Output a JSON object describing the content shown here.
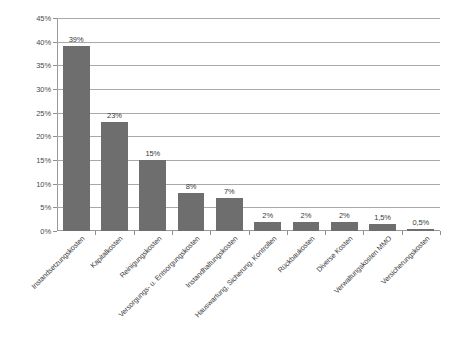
{
  "chart_data": {
    "type": "bar",
    "title": "",
    "subtitle": "",
    "xlabel": "",
    "ylabel": "",
    "ylim": [
      0,
      45
    ],
    "ytick_labels": [
      "0%",
      "5%",
      "10%",
      "15%",
      "20%",
      "25%",
      "30%",
      "35%",
      "40%",
      "45%"
    ],
    "ytick_values": [
      0,
      5,
      10,
      15,
      20,
      25,
      30,
      35,
      40,
      45
    ],
    "grid": true,
    "legend": "none",
    "bar_color": "#6e6e6e",
    "gridline_color": "#a9a9a9",
    "axis_color": "#9a9a9a",
    "categories": [
      "Instandsetzungskosten",
      "Kapitalkosten",
      "Reinigungskosten",
      "Versorgungs- u. Entsorgungskosten",
      "Instandhaltungskosten",
      "Hauswartung, Sicherung, Kontrollen",
      "Rückbaukosten",
      "Diverse Kosten",
      "Verwaltungskosten MMO",
      "Versicherungskosten"
    ],
    "values": [
      39,
      23,
      15,
      8,
      7,
      2,
      2,
      2,
      1.5,
      0.5
    ],
    "value_labels": [
      "39%",
      "23%",
      "15%",
      "8%",
      "7%",
      "2%",
      "2%",
      "2%",
      "1,5%",
      "0,5%"
    ]
  }
}
